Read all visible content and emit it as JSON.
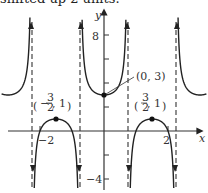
{
  "caption": "shifted up 2 units.",
  "chart_data": {
    "type": "line",
    "title": "",
    "function": "y = 2 + sec(2πx/3)",
    "xlabel": "x",
    "ylabel": "y",
    "xlim": [
      -3.25,
      3.25
    ],
    "ylim": [
      -5,
      10
    ],
    "x_ticks": [
      {
        "value": -2,
        "label": "-2"
      },
      {
        "value": 2,
        "label": "2"
      }
    ],
    "y_ticks": [
      {
        "value": 8,
        "label": "8"
      },
      {
        "value": 6,
        "label": ""
      },
      {
        "value": 4,
        "label": ""
      },
      {
        "value": 2,
        "label": ""
      },
      {
        "value": -2,
        "label": ""
      },
      {
        "value": -4,
        "label": "-4"
      }
    ],
    "asymptotes": [
      -2.25,
      -0.75,
      0.75,
      2.25
    ],
    "points": [
      {
        "x": 0,
        "y": 3,
        "label": "(0, 3)"
      },
      {
        "x": -1.5,
        "y": 1,
        "label": "(-3/2, 1)"
      },
      {
        "x": 1.5,
        "y": 1,
        "label": "(3/2, 1)"
      }
    ],
    "grid": false,
    "legend": null
  },
  "labels": {
    "y_axis": "y",
    "x_axis": "x",
    "tick_8": "8",
    "tick_m4": "−4",
    "tick_m2": "−2",
    "tick_2": "2",
    "pt_center": "(0, 3)",
    "pt_left_a": "−",
    "pt_left_frac_n": "3",
    "pt_left_frac_d": "2",
    "pt_right_frac_n": "3",
    "pt_right_frac_d": "2",
    "pt_comma_one": ", 1"
  }
}
